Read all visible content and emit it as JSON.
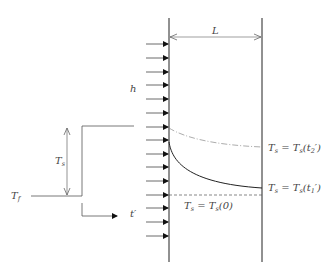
{
  "diagram": {
    "type": "heat-conduction-slab",
    "colors": {
      "line": "#222222",
      "label": "#444444",
      "thin_line": "#555555"
    },
    "slab": {
      "width_label": "L",
      "left_x": 169,
      "right_x": 262,
      "top_y": 18,
      "bottom_y": 262
    },
    "convection": {
      "label": "h",
      "arrow_count": 15,
      "arrow_y": [
        44,
        58,
        72,
        85,
        99,
        113,
        127,
        140,
        154,
        167,
        181,
        195,
        208,
        222,
        236
      ]
    },
    "step_input": {
      "initial_label": "T",
      "initial_sub": "f",
      "step_label": "T",
      "step_sub": "s",
      "time_label": "t′"
    },
    "curves": [
      {
        "name": "T_s(t2')",
        "style": "dash-dot",
        "label_main": "T",
        "label_sub": "s",
        "label_eq": " = T",
        "label_eq_sub": "s",
        "label_arg": "(t",
        "label_arg_sub": "2",
        "label_close": "′)"
      },
      {
        "name": "T_s(t1')",
        "style": "solid",
        "label_main": "T",
        "label_sub": "s",
        "label_eq": " = T",
        "label_eq_sub": "s",
        "label_arg": "(t",
        "label_arg_sub": "1",
        "label_close": "′)"
      },
      {
        "name": "T_s(0)",
        "style": "dashed",
        "label_main": "T",
        "label_sub": "s",
        "label_eq": " = T",
        "label_eq_sub": "s",
        "label_arg": "(0)"
      }
    ]
  }
}
